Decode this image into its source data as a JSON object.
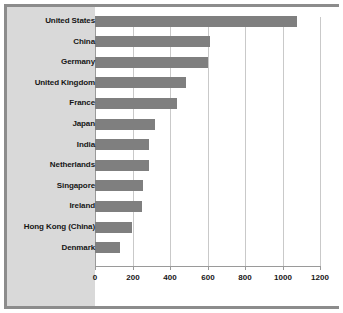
{
  "chart_data": {
    "type": "bar",
    "orientation": "horizontal",
    "title": "",
    "subtitle": "",
    "xlabel": "",
    "ylabel": "",
    "categories": [
      "United States",
      "China",
      "Germany",
      "United Kingdom",
      "France",
      "Japan",
      "India",
      "Netherlands",
      "Singapore",
      "Ireland",
      "Hong Kong (China)",
      "Denmark"
    ],
    "values": [
      1075,
      615,
      600,
      485,
      437,
      320,
      288,
      288,
      255,
      250,
      195,
      135
    ],
    "xlim": [
      0,
      1200
    ],
    "xticks": [
      0,
      200,
      400,
      600,
      800,
      1000,
      1200
    ],
    "xtick_labels": [
      "0",
      "200",
      "400",
      "600",
      "800",
      "1000",
      "1200"
    ],
    "grid": true,
    "grid_axis": "x",
    "legend": false,
    "legend_position": "none",
    "series": [
      {
        "name": "",
        "values": [
          1075,
          615,
          600,
          485,
          437,
          320,
          288,
          288,
          255,
          250,
          195,
          135
        ]
      }
    ]
  },
  "style": {
    "bar_color": "#7f7f7f",
    "panel_color": "#d9d9d9",
    "plot_background": "#ffffff",
    "frame_color": "#8c8c8c",
    "grid_color": "#c9c9c9",
    "axis_color": "#9a9a9a",
    "text_color": "#161616"
  }
}
